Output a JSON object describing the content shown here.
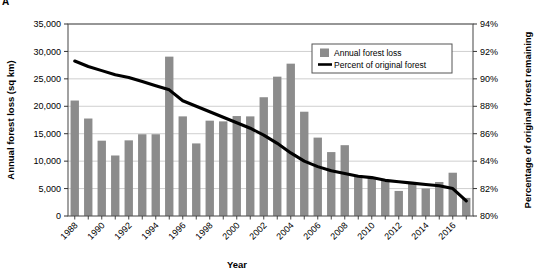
{
  "panel": {
    "label": "A"
  },
  "chart_data": {
    "type": "bar",
    "title": "",
    "subtitle": "",
    "xlabel": "Year",
    "ylabel": "Annual forest loss (sq km)",
    "y2label": "Percentage of original forest remaining",
    "grid": true,
    "legend_position": "top-center",
    "x": [
      1988,
      1989,
      1990,
      1991,
      1992,
      1993,
      1994,
      1995,
      1996,
      1997,
      1998,
      1999,
      2000,
      2001,
      2002,
      2003,
      2004,
      2005,
      2006,
      2007,
      2008,
      2009,
      2010,
      2011,
      2012,
      2013,
      2014,
      2015,
      2016,
      2017
    ],
    "categories": [
      "1988",
      "1989",
      "1990",
      "1991",
      "1992",
      "1993",
      "1994",
      "1995",
      "1996",
      "1997",
      "1998",
      "1999",
      "2000",
      "2001",
      "2002",
      "2003",
      "2004",
      "2005",
      "2006",
      "2007",
      "2008",
      "2009",
      "2010",
      "2011",
      "2012",
      "2013",
      "2014",
      "2015",
      "2016",
      "2017"
    ],
    "xtick_labels": [
      "1988",
      "1990",
      "1992",
      "1994",
      "1996",
      "1998",
      "2000",
      "2002",
      "2004",
      "2006",
      "2008",
      "2010",
      "2012",
      "2014",
      "2016"
    ],
    "ytick_labels": [
      "0",
      "5,000",
      "10,000",
      "15,000",
      "20,000",
      "25,000",
      "30,000",
      "35,000"
    ],
    "ytick_values": [
      0,
      5000,
      10000,
      15000,
      20000,
      25000,
      30000,
      35000
    ],
    "y2tick_labels": [
      "80%",
      "82%",
      "84%",
      "86%",
      "88%",
      "90%",
      "92%",
      "94%"
    ],
    "y2tick_values": [
      80,
      82,
      84,
      86,
      88,
      90,
      92,
      94
    ],
    "ylim": [
      0,
      35000
    ],
    "y2lim": [
      80,
      94
    ],
    "bar_color": "#8c8c8c",
    "line_color": "#000000",
    "series": [
      {
        "name": "Annual forest loss",
        "type": "bar",
        "axis": "left",
        "units": "sq km",
        "values": [
          21050,
          17770,
          13730,
          11030,
          13790,
          14900,
          14900,
          29050,
          18160,
          13230,
          17380,
          17250,
          18220,
          18160,
          21650,
          25400,
          27770,
          19010,
          14290,
          11650,
          12910,
          7460,
          7000,
          6420,
          4570,
          5890,
          5010,
          6200,
          7890,
          3300
        ]
      },
      {
        "name": "Percent of original forest",
        "type": "line",
        "axis": "right",
        "units": "%",
        "values": [
          91.3,
          90.9,
          90.6,
          90.3,
          90.1,
          89.8,
          89.5,
          89.2,
          88.4,
          88.0,
          87.6,
          87.2,
          86.8,
          86.4,
          85.9,
          85.3,
          84.6,
          84.0,
          83.6,
          83.3,
          83.1,
          82.9,
          82.8,
          82.6,
          82.5,
          82.4,
          82.3,
          82.2,
          82.0,
          81.1
        ]
      }
    ],
    "legend": [
      {
        "label": "Annual forest loss",
        "marker": "square",
        "color": "#8c8c8c"
      },
      {
        "label": "Percent of original forest",
        "marker": "line",
        "color": "#000000"
      }
    ]
  }
}
